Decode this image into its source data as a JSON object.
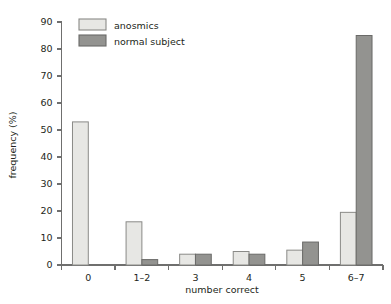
{
  "chart_data": {
    "type": "bar",
    "title": "",
    "subtitle": "",
    "xlabel": "number correct",
    "ylabel": "frequency (%)",
    "categories": [
      "0",
      "1–2",
      "3",
      "4",
      "5",
      "6–7"
    ],
    "series": [
      {
        "name": "anosmics",
        "color": "#e7e7e4",
        "values": [
          53,
          16,
          4,
          5,
          5.5,
          19.5
        ]
      },
      {
        "name": "normal subject",
        "color": "#939390",
        "values": [
          0,
          2,
          4,
          4,
          8.5,
          85
        ]
      }
    ],
    "ylim": [
      0,
      90
    ],
    "yticks": [
      0,
      10,
      20,
      30,
      40,
      50,
      60,
      70,
      80,
      90
    ],
    "ytick_labels": [
      "0",
      "10",
      "20",
      "30",
      "40",
      "50",
      "60",
      "70",
      "80",
      "90"
    ],
    "grid": false,
    "legend_position": "top-left",
    "legend_entries": [
      "anosmics",
      "normal subject"
    ]
  },
  "axes": {
    "y_title": "frequency (%)",
    "x_title": "number correct"
  },
  "legend": {
    "items": [
      {
        "label": "anosmics",
        "swatch": "light-gray-swatch"
      },
      {
        "label": "normal subject",
        "swatch": "dark-gray-swatch"
      }
    ]
  },
  "colors": {
    "anosmics_fill": "#e7e7e4",
    "anosmics_stroke": "#8a8a87",
    "normal_fill": "#939390",
    "normal_stroke": "#6a6a68",
    "axis": "#6f6f6e",
    "text": "#231f20",
    "background": "#ffffff"
  }
}
